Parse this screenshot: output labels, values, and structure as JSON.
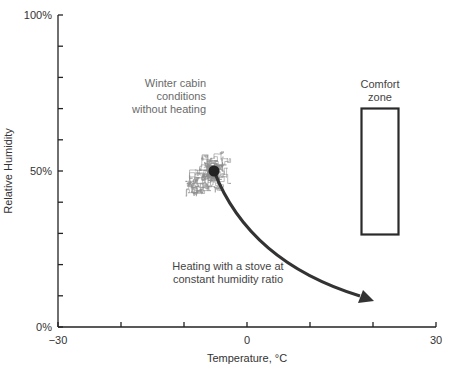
{
  "chart_data": {
    "type": "scatter",
    "title": "",
    "xlabel": "Temperature, °C",
    "ylabel": "Relative Humidity",
    "xlim": [
      -30,
      30
    ],
    "ylim": [
      0,
      100
    ],
    "x_ticks": [
      -30,
      -20,
      -10,
      0,
      10,
      20,
      30
    ],
    "x_tick_labels": [
      "−30",
      "0",
      "30"
    ],
    "x_tick_label_values": [
      -30,
      0,
      30
    ],
    "y_ticks": [
      0,
      10,
      20,
      30,
      40,
      50,
      60,
      70,
      80,
      90,
      100
    ],
    "y_tick_labels": [
      "0%",
      "50%",
      "100%"
    ],
    "y_tick_label_values": [
      0,
      50,
      100
    ],
    "grid": false,
    "series": [
      {
        "name": "Winter cabin conditions without heating",
        "kind": "random-walk trace",
        "color": "#8a8a8a",
        "x_range": [
          -15,
          4
        ],
        "y_range": [
          35,
          71
        ],
        "center": [
          -6,
          50
        ]
      },
      {
        "name": "Heating with a stove at constant humidity ratio",
        "kind": "arrow",
        "color": "#333333",
        "start": [
          -6,
          50
        ],
        "end": [
          20,
          9
        ]
      },
      {
        "name": "Comfort zone",
        "kind": "rectangle",
        "x_range": [
          18,
          24
        ],
        "y_range": [
          30,
          70
        ]
      }
    ],
    "annotations": [
      {
        "text": [
          "Winter cabin",
          "conditions",
          "without heating"
        ],
        "x": -16,
        "y": 78
      },
      {
        "text": [
          "Heating with a stove at",
          "constant humidity ratio"
        ],
        "x": -3,
        "y": 19
      },
      {
        "text": [
          "Comfort",
          "zone"
        ],
        "x": 21,
        "y": 77
      }
    ]
  },
  "labels": {
    "x_axis_title": "Temperature, °C",
    "y_axis_title": "Relative Humidity",
    "x_min": "−30",
    "x_mid": "0",
    "x_max": "30",
    "y_min": "0%",
    "y_mid": "50%",
    "y_max": "100%",
    "winter_line1": "Winter cabin",
    "winter_line2": "conditions",
    "winter_line3": "without heating",
    "heating_line1": "Heating with a stove at",
    "heating_line2": "constant humidity ratio",
    "comfort_line1": "Comfort",
    "comfort_line2": "zone"
  }
}
